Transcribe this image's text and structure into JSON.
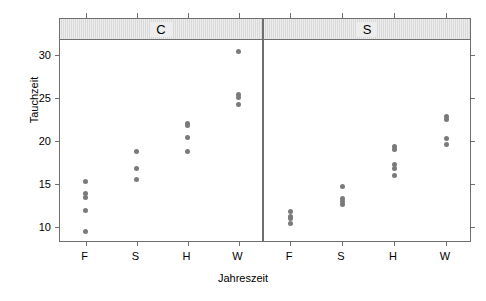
{
  "chart_data": {
    "type": "scatter",
    "title": "",
    "xlabel": "Jahreszeit",
    "ylabel": "Tauchzeit",
    "categories": [
      "F",
      "S",
      "H",
      "W"
    ],
    "ylim": [
      8.3,
      31.8
    ],
    "yticks": [
      10,
      15,
      20,
      25,
      30
    ],
    "ytick_labels": [
      "10",
      "15",
      "20",
      "25",
      "30"
    ],
    "grid": false,
    "legend": null,
    "panel_variable": "Art",
    "panels": [
      {
        "label": "C",
        "groups": [
          {
            "category": "F",
            "values": [
              15.3,
              13.9,
              13.5,
              12.0,
              9.5
            ]
          },
          {
            "category": "S",
            "values": [
              18.8,
              16.8,
              15.6
            ]
          },
          {
            "category": "H",
            "values": [
              22.1,
              21.8,
              20.4,
              18.8
            ]
          },
          {
            "category": "W",
            "values": [
              30.5,
              25.5,
              25.1,
              24.3
            ]
          }
        ]
      },
      {
        "label": "S",
        "groups": [
          {
            "category": "F",
            "values": [
              11.8,
              11.3,
              11.0,
              10.5
            ]
          },
          {
            "category": "S",
            "values": [
              14.7,
              13.4,
              13.0,
              12.7
            ]
          },
          {
            "category": "H",
            "values": [
              19.4,
              19.1,
              17.3,
              16.9,
              16.0
            ]
          },
          {
            "category": "W",
            "values": [
              22.9,
              22.6,
              20.3,
              19.7
            ]
          }
        ]
      }
    ],
    "point_color": "#7a7a7a",
    "strip_color": "#ededed",
    "frame_color": "#6f6f6f"
  }
}
